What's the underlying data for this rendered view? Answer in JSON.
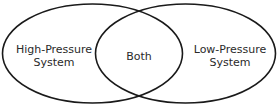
{
  "diagram": {
    "type": "venn",
    "sets": [
      {
        "label_line1": "High-Pressure",
        "label_line2": "System"
      },
      {
        "label_line1": "Low-Pressure",
        "label_line2": "System"
      }
    ],
    "intersection": {
      "label": "Both"
    },
    "colors": {
      "stroke": "#1a1a1a",
      "text": "#2a2a2a",
      "background": "#ffffff"
    }
  }
}
